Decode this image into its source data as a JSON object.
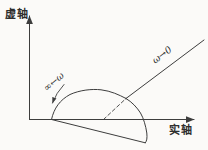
{
  "figure": {
    "kind": "nyquist-plot-diagram",
    "axes": {
      "imaginary_axis_label": "虚轴",
      "real_axis_label": "实轴"
    },
    "annotations": {
      "omega_to_zero_label": "ω→0",
      "omega_to_infinity_label": "∞←ω"
    },
    "colors": {
      "background": "#fbfaf8",
      "stroke": "#3d3d3d"
    }
  }
}
